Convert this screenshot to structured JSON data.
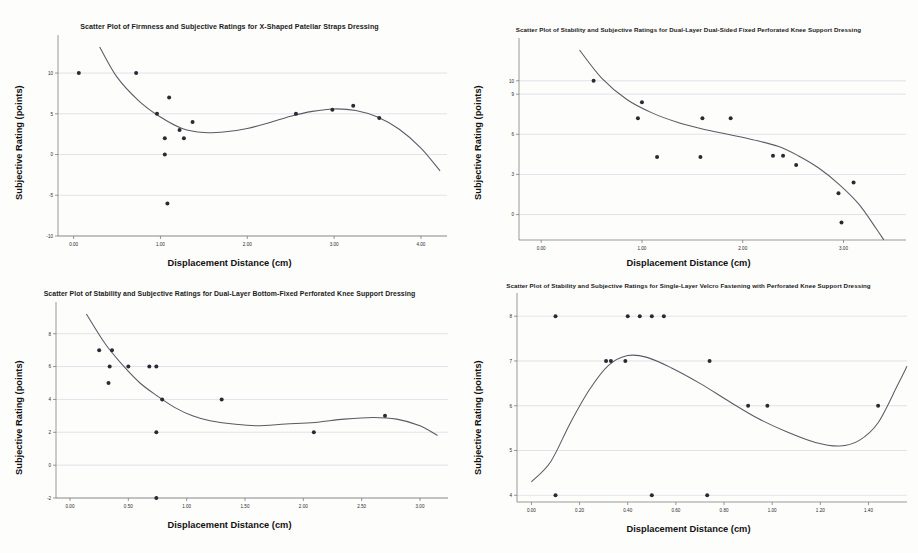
{
  "figure": {
    "layout": "2x2-grid",
    "background": "#fdfdfc",
    "point_color": "#2a2a33",
    "curve_color": "#5a5a66",
    "gridline_color": "#c9c9d6"
  },
  "panels": [
    {
      "id": "top-left",
      "chart_data": {
        "type": "scatter",
        "title": "Scatter Plot of Firmness and Subjective Ratings for X-Shaped Patellar Straps Dressing",
        "xlabel": "Displacement Distance (cm)",
        "ylabel": "Subjective Rating (points)",
        "xlim": [
          -0.18,
          4.3
        ],
        "ylim": [
          -10.0,
          13.2
        ],
        "xticks": [
          0.0,
          1.0,
          2.0,
          3.0,
          4.0
        ],
        "xticklabels": [
          "0.00",
          "1.00",
          "2.00",
          "3.00",
          "4.00"
        ],
        "yticks": [
          10,
          5,
          0,
          -5,
          -10
        ],
        "yticklabels": [
          "10",
          "5",
          "0",
          "-5",
          "-10"
        ],
        "grid": true,
        "legend": "none",
        "points": [
          {
            "x": 0.06,
            "y": 10.0
          },
          {
            "x": 0.72,
            "y": 10.0
          },
          {
            "x": 0.96,
            "y": 5.0
          },
          {
            "x": 1.1,
            "y": 7.0
          },
          {
            "x": 1.05,
            "y": 2.0
          },
          {
            "x": 1.05,
            "y": 0.0
          },
          {
            "x": 1.08,
            "y": -6.0
          },
          {
            "x": 1.22,
            "y": 3.0
          },
          {
            "x": 1.27,
            "y": 2.0
          },
          {
            "x": 1.37,
            "y": 4.0
          },
          {
            "x": 2.56,
            "y": 5.0
          },
          {
            "x": 2.98,
            "y": 5.5
          },
          {
            "x": 3.22,
            "y": 6.0
          },
          {
            "x": 3.52,
            "y": 4.5
          }
        ],
        "fit_curve": [
          {
            "x": 0.3,
            "y": 13.2
          },
          {
            "x": 0.5,
            "y": 9.5
          },
          {
            "x": 0.75,
            "y": 6.6
          },
          {
            "x": 1.0,
            "y": 4.6
          },
          {
            "x": 1.25,
            "y": 3.2
          },
          {
            "x": 1.5,
            "y": 2.7
          },
          {
            "x": 1.75,
            "y": 2.8
          },
          {
            "x": 2.0,
            "y": 3.2
          },
          {
            "x": 2.25,
            "y": 3.9
          },
          {
            "x": 2.5,
            "y": 4.7
          },
          {
            "x": 2.75,
            "y": 5.3
          },
          {
            "x": 3.0,
            "y": 5.6
          },
          {
            "x": 3.25,
            "y": 5.4
          },
          {
            "x": 3.5,
            "y": 4.6
          },
          {
            "x": 3.75,
            "y": 3.1
          },
          {
            "x": 4.0,
            "y": 0.8
          },
          {
            "x": 4.22,
            "y": -2.0
          }
        ]
      }
    },
    {
      "id": "top-right",
      "chart_data": {
        "type": "scatter",
        "title": "Scatter Plot of Stability and Subjective Ratings for Dual-Layer Dual-Sided Fixed Perforated Knee Support Dressing",
        "xlabel": "Displacement Distance (cm)",
        "ylabel": "Subjective Rating (points)",
        "xlim": [
          -0.22,
          3.62
        ],
        "ylim": [
          -1.9,
          12.3
        ],
        "xticks": [
          0.0,
          1.0,
          2.0,
          3.0
        ],
        "xticklabels": [
          "0.00",
          "1.00",
          "2.00",
          "3.00"
        ],
        "yticks": [
          10,
          9,
          6,
          3,
          0
        ],
        "yticklabels": [
          "10",
          "9",
          "6",
          "3",
          "0"
        ],
        "grid": true,
        "legend": "none",
        "points": [
          {
            "x": 0.52,
            "y": 10.0
          },
          {
            "x": 1.0,
            "y": 8.4
          },
          {
            "x": 0.96,
            "y": 7.2
          },
          {
            "x": 1.6,
            "y": 7.2
          },
          {
            "x": 1.88,
            "y": 7.2
          },
          {
            "x": 1.15,
            "y": 4.3
          },
          {
            "x": 1.58,
            "y": 4.3
          },
          {
            "x": 2.3,
            "y": 4.4
          },
          {
            "x": 2.4,
            "y": 4.4
          },
          {
            "x": 2.53,
            "y": 3.7
          },
          {
            "x": 3.1,
            "y": 2.4
          },
          {
            "x": 2.95,
            "y": 1.6
          },
          {
            "x": 2.98,
            "y": -0.6
          }
        ],
        "fit_curve": [
          {
            "x": 0.38,
            "y": 12.3
          },
          {
            "x": 0.6,
            "y": 10.2
          },
          {
            "x": 0.85,
            "y": 8.6
          },
          {
            "x": 1.1,
            "y": 7.6
          },
          {
            "x": 1.35,
            "y": 6.9
          },
          {
            "x": 1.6,
            "y": 6.4
          },
          {
            "x": 1.85,
            "y": 6.0
          },
          {
            "x": 2.1,
            "y": 5.6
          },
          {
            "x": 2.35,
            "y": 5.1
          },
          {
            "x": 2.55,
            "y": 4.4
          },
          {
            "x": 2.75,
            "y": 3.5
          },
          {
            "x": 2.95,
            "y": 2.3
          },
          {
            "x": 3.15,
            "y": 0.8
          },
          {
            "x": 3.32,
            "y": -1.0
          },
          {
            "x": 3.4,
            "y": -1.9
          }
        ]
      }
    },
    {
      "id": "bottom-left",
      "chart_data": {
        "type": "scatter",
        "title": "Scatter Plot of Stability and Subjective Ratings for Dual-Layer Bottom-Fixed Perforated Knee Support Dressing",
        "xlabel": "Displacement Distance (cm)",
        "ylabel": "Subjective Rating (points)",
        "xlim": [
          -0.12,
          3.24
        ],
        "ylim": [
          -2.0,
          9.2
        ],
        "xticks": [
          0.0,
          0.5,
          1.0,
          1.5,
          2.0,
          2.5,
          3.0
        ],
        "xticklabels": [
          "0.00",
          "0.50",
          "1.00",
          "1.50",
          "2.00",
          "2.50",
          "3.00"
        ],
        "yticks": [
          8,
          6,
          4,
          2,
          0,
          -2
        ],
        "yticklabels": [
          "8",
          "6",
          "4",
          "2",
          "0",
          "-2"
        ],
        "grid": true,
        "legend": "none",
        "points": [
          {
            "x": 0.25,
            "y": 7.0
          },
          {
            "x": 0.36,
            "y": 7.0
          },
          {
            "x": 0.34,
            "y": 6.0
          },
          {
            "x": 0.5,
            "y": 6.0
          },
          {
            "x": 0.68,
            "y": 6.0
          },
          {
            "x": 0.74,
            "y": 6.0
          },
          {
            "x": 0.33,
            "y": 5.0
          },
          {
            "x": 0.79,
            "y": 4.0
          },
          {
            "x": 1.3,
            "y": 4.0
          },
          {
            "x": 0.74,
            "y": 2.0
          },
          {
            "x": 2.09,
            "y": 2.0
          },
          {
            "x": 2.7,
            "y": 3.0
          },
          {
            "x": 0.74,
            "y": -2.0
          }
        ],
        "fit_curve": [
          {
            "x": 0.14,
            "y": 9.2
          },
          {
            "x": 0.3,
            "y": 7.4
          },
          {
            "x": 0.45,
            "y": 6.1
          },
          {
            "x": 0.6,
            "y": 5.0
          },
          {
            "x": 0.75,
            "y": 4.2
          },
          {
            "x": 0.9,
            "y": 3.5
          },
          {
            "x": 1.05,
            "y": 3.0
          },
          {
            "x": 1.2,
            "y": 2.7
          },
          {
            "x": 1.4,
            "y": 2.5
          },
          {
            "x": 1.6,
            "y": 2.4
          },
          {
            "x": 1.85,
            "y": 2.5
          },
          {
            "x": 2.1,
            "y": 2.6
          },
          {
            "x": 2.35,
            "y": 2.8
          },
          {
            "x": 2.6,
            "y": 2.9
          },
          {
            "x": 2.8,
            "y": 2.8
          },
          {
            "x": 3.0,
            "y": 2.4
          },
          {
            "x": 3.15,
            "y": 1.8
          }
        ]
      }
    },
    {
      "id": "bottom-right",
      "chart_data": {
        "type": "scatter",
        "title": "Scatter Plot of Stability and Subjective Ratings for Single-Layer Velcro Fastening with Perforated Knee Support Dressing",
        "xlabel": "Displacement Distance (cm)",
        "ylabel": "Subjective Rating (points)",
        "xlim": [
          -0.06,
          1.56
        ],
        "ylim": [
          3.85,
          8.25
        ],
        "xticks": [
          0.0,
          0.2,
          0.4,
          0.6,
          0.8,
          1.0,
          1.2,
          1.4
        ],
        "xticklabels": [
          "0.00",
          "0.20",
          "0.40",
          "0.60",
          "0.80",
          "1.00",
          "1.20",
          "1.40"
        ],
        "yticks": [
          8,
          7,
          6,
          5,
          4
        ],
        "yticklabels": [
          "8",
          "7",
          "6",
          "5",
          "4"
        ],
        "grid": true,
        "legend": "none",
        "points": [
          {
            "x": 0.1,
            "y": 8.0
          },
          {
            "x": 0.4,
            "y": 8.0
          },
          {
            "x": 0.45,
            "y": 8.0
          },
          {
            "x": 0.5,
            "y": 8.0
          },
          {
            "x": 0.55,
            "y": 8.0
          },
          {
            "x": 0.31,
            "y": 7.0
          },
          {
            "x": 0.33,
            "y": 7.0
          },
          {
            "x": 0.39,
            "y": 7.0
          },
          {
            "x": 0.74,
            "y": 7.0
          },
          {
            "x": 0.9,
            "y": 6.0
          },
          {
            "x": 0.98,
            "y": 6.0
          },
          {
            "x": 1.44,
            "y": 6.0
          },
          {
            "x": 0.1,
            "y": 4.0
          },
          {
            "x": 0.5,
            "y": 4.0
          },
          {
            "x": 0.73,
            "y": 4.0
          }
        ],
        "fit_curve": [
          {
            "x": 0.0,
            "y": 4.3
          },
          {
            "x": 0.08,
            "y": 4.75
          },
          {
            "x": 0.16,
            "y": 5.6
          },
          {
            "x": 0.24,
            "y": 6.35
          },
          {
            "x": 0.32,
            "y": 6.9
          },
          {
            "x": 0.4,
            "y": 7.12
          },
          {
            "x": 0.48,
            "y": 7.08
          },
          {
            "x": 0.58,
            "y": 6.85
          },
          {
            "x": 0.7,
            "y": 6.5
          },
          {
            "x": 0.82,
            "y": 6.1
          },
          {
            "x": 0.94,
            "y": 5.72
          },
          {
            "x": 1.06,
            "y": 5.42
          },
          {
            "x": 1.18,
            "y": 5.18
          },
          {
            "x": 1.28,
            "y": 5.1
          },
          {
            "x": 1.36,
            "y": 5.22
          },
          {
            "x": 1.44,
            "y": 5.62
          },
          {
            "x": 1.52,
            "y": 6.45
          },
          {
            "x": 1.56,
            "y": 6.88
          }
        ]
      }
    }
  ]
}
